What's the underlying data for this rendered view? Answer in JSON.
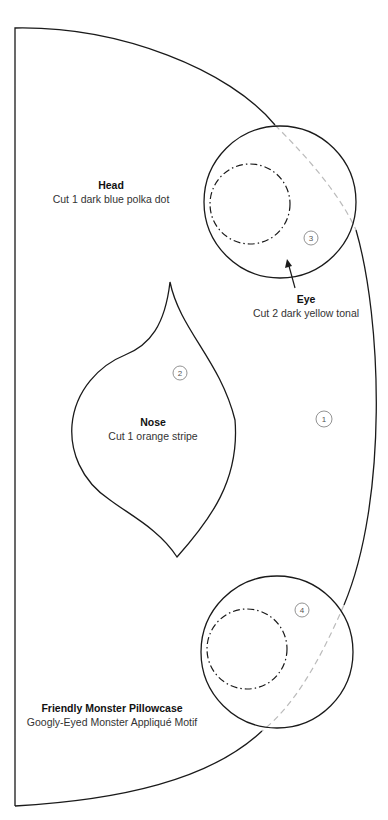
{
  "pieces": {
    "head": {
      "title": "Head",
      "instruction": "Cut 1 dark blue polka dot",
      "number": "1"
    },
    "nose": {
      "title": "Nose",
      "instruction": "Cut 1 orange stripe",
      "number": "2"
    },
    "eye": {
      "title": "Eye",
      "instruction": "Cut 2 dark yellow tonal",
      "number_top": "3",
      "number_bottom": "4"
    }
  },
  "footer": {
    "title": "Friendly Monster Pillowcase",
    "subtitle": "Googly-Eyed Monster Appliqué Motif"
  },
  "colors": {
    "outline": "#1a1a1a",
    "hidden_line": "#bbbbbb",
    "number_circle": "#777777"
  }
}
